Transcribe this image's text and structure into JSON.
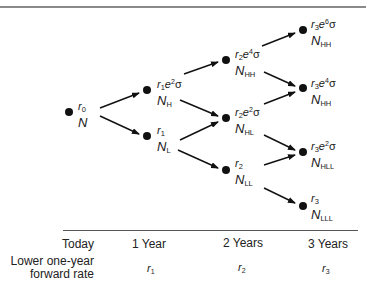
{
  "tree": {
    "nodes": [
      {
        "id": "today",
        "rate": "r",
        "rate_sub": "0",
        "exp": "",
        "value": "N",
        "value_sub": ""
      },
      {
        "id": "year1-high",
        "rate": "r",
        "rate_sub": "1",
        "exp": "2",
        "value": "N",
        "value_sub": "H"
      },
      {
        "id": "year1-low",
        "rate": "r",
        "rate_sub": "1",
        "exp": "",
        "value": "N",
        "value_sub": "L"
      },
      {
        "id": "year2-hh",
        "rate": "r",
        "rate_sub": "2",
        "exp": "4",
        "value": "N",
        "value_sub": "HH"
      },
      {
        "id": "year2-hl",
        "rate": "r",
        "rate_sub": "2",
        "exp": "2",
        "value": "N",
        "value_sub": "HL"
      },
      {
        "id": "year2-ll",
        "rate": "r",
        "rate_sub": "2",
        "exp": "",
        "value": "N",
        "value_sub": "LL"
      },
      {
        "id": "year3-hhh",
        "rate": "r",
        "rate_sub": "3",
        "exp": "6",
        "value": "N",
        "value_sub": "HH"
      },
      {
        "id": "year3-hhl",
        "rate": "r",
        "rate_sub": "3",
        "exp": "4",
        "value": "N",
        "value_sub": "HH"
      },
      {
        "id": "year3-hll",
        "rate": "r",
        "rate_sub": "3",
        "exp": "2",
        "value": "N",
        "value_sub": "HLL"
      },
      {
        "id": "year3-lll",
        "rate": "r",
        "rate_sub": "3",
        "exp": "",
        "value": "N",
        "value_sub": "LLL"
      }
    ],
    "e": "e",
    "sigma": "σ"
  },
  "axis": {
    "labels": [
      "Today",
      "1 Year",
      "2 Years",
      "3 Years"
    ],
    "row_label_line1": "Lower one-year",
    "row_label_line2": "forward rate",
    "rates": [
      {
        "r": "r",
        "sub": "1"
      },
      {
        "r": "r",
        "sub": "2"
      },
      {
        "r": "r",
        "sub": "3"
      }
    ]
  }
}
